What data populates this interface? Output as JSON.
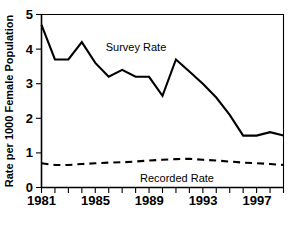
{
  "chart_data": {
    "type": "line",
    "title": "",
    "xlabel": "",
    "ylabel": "Rate per 1000 Female Population",
    "xlim": [
      1981,
      1999
    ],
    "ylim": [
      0,
      5
    ],
    "grid": false,
    "legend_position": "inline-annotations",
    "x": [
      1981,
      1982,
      1983,
      1984,
      1985,
      1986,
      1987,
      1988,
      1989,
      1990,
      1991,
      1992,
      1993,
      1994,
      1995,
      1996,
      1997,
      1998,
      1999
    ],
    "xtick_values": [
      1981,
      1982,
      1983,
      1984,
      1985,
      1986,
      1987,
      1988,
      1989,
      1990,
      1991,
      1992,
      1993,
      1994,
      1995,
      1996,
      1997,
      1998,
      1999
    ],
    "xtick_labels": [
      "1981",
      "1985",
      "1989",
      "1993",
      "1997"
    ],
    "xtick_labeled_values": [
      1981,
      1985,
      1989,
      1993,
      1997
    ],
    "ytick_values": [
      0,
      1,
      2,
      3,
      4,
      5
    ],
    "ytick_labels": [
      "0",
      "1",
      "2",
      "3",
      "4",
      "5"
    ],
    "series": [
      {
        "name": "Survey Rate",
        "style": "solid",
        "annotation": "Survey Rate",
        "values": [
          4.7,
          3.7,
          3.7,
          4.2,
          3.6,
          3.2,
          3.4,
          3.2,
          3.2,
          2.65,
          3.7,
          3.35,
          3.0,
          2.6,
          2.1,
          1.5,
          1.5,
          1.6,
          1.5
        ]
      },
      {
        "name": "Recorded Rate",
        "style": "dashed",
        "annotation": "Recorded Rate",
        "values": [
          0.7,
          0.65,
          0.65,
          0.68,
          0.7,
          0.72,
          0.73,
          0.75,
          0.78,
          0.8,
          0.82,
          0.83,
          0.8,
          0.78,
          0.75,
          0.72,
          0.7,
          0.68,
          0.65
        ]
      }
    ]
  },
  "annotations": {
    "survey_label": "Survey Rate",
    "recorded_label": "Recorded Rate"
  },
  "axes": {
    "y_title": "Rate per 1000 Female Population",
    "y_labels": [
      "5",
      "4",
      "3",
      "2",
      "1",
      "0"
    ],
    "x_labels": [
      "1981",
      "1985",
      "1989",
      "1993",
      "1997"
    ]
  },
  "colors": {
    "line": "#000000",
    "background": "#ffffff",
    "text": "#000000"
  }
}
